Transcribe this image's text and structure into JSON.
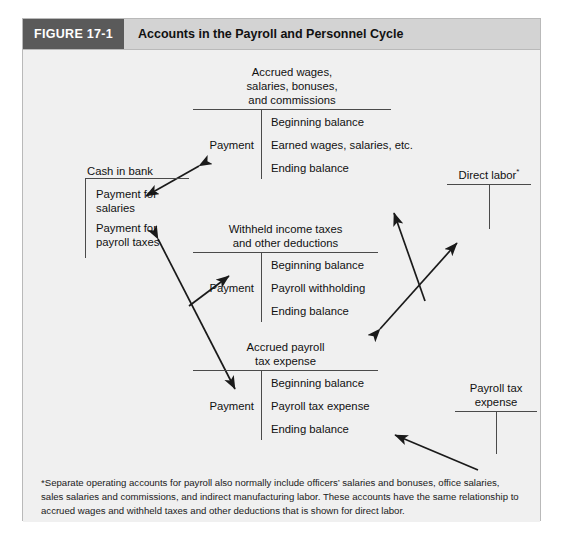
{
  "figure": {
    "number": "FIGURE 17-1",
    "title": "Accounts in the Payroll and Personnel Cycle"
  },
  "accounts": {
    "cash_in_bank": {
      "title": "Cash in bank",
      "entries": [
        "Payment for\nsalaries",
        "Payment for\npayroll taxes"
      ]
    },
    "accrued_wages": {
      "title": "Accrued wages,\nsalaries, bonuses,\nand commissions",
      "left_label": "Payment",
      "entries": [
        "Beginning balance",
        "Earned wages, salaries, etc.",
        "Ending balance"
      ]
    },
    "withheld_taxes": {
      "title": "Withheld income taxes\nand other deductions",
      "left_label": "Payment",
      "entries": [
        "Beginning balance",
        "Payroll withholding",
        "Ending balance"
      ]
    },
    "accrued_payroll_tax": {
      "title": "Accrued payroll\ntax expense",
      "left_label": "Payment",
      "entries": [
        "Beginning balance",
        "Payroll tax expense",
        "Ending balance"
      ]
    },
    "direct_labor": {
      "title": "Direct labor",
      "footnote_marker": "*"
    },
    "payroll_tax_expense": {
      "title": "Payroll tax\nexpense"
    }
  },
  "footnote": {
    "text": "*Separate operating accounts for payroll also normally include officers’ salaries and bonuses, office salaries, sales salaries and commissions, and indirect manufacturing labor. These accounts have the same relationship to accrued wages and withheld taxes and other deductions that is shown for direct labor."
  },
  "colors": {
    "panel_background": "#f0f0f0",
    "header_band": "#d3d3d3",
    "figure_number_block": "#5a5a5a",
    "rule_line": "#4a4a4a",
    "arrow": "#1a1a1a",
    "border": "#b9b9b9"
  }
}
